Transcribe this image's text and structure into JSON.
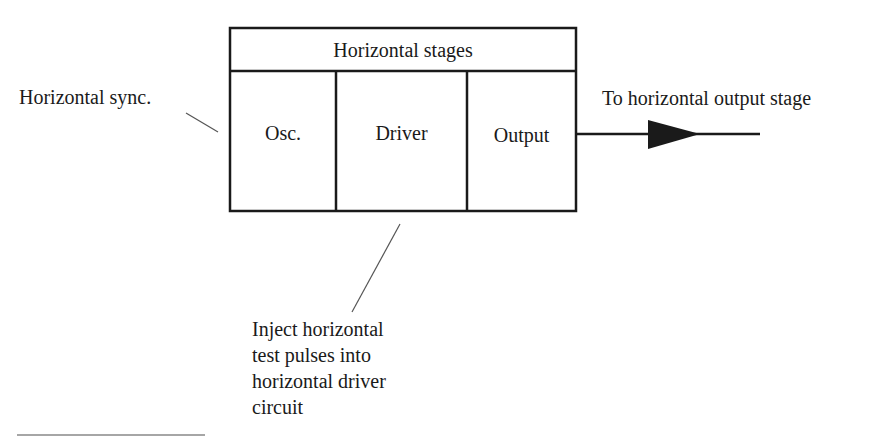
{
  "diagram": {
    "block": {
      "title": "Horizontal stages",
      "stages": [
        "Osc.",
        "Driver",
        "Output"
      ]
    },
    "labels": {
      "sync_input": "Horizontal sync.",
      "output_destination": "To horizontal output stage",
      "inject_note": [
        "Inject horizontal",
        "test pulses into",
        "horizontal driver",
        "circuit"
      ]
    },
    "colors": {
      "line": "#1a1a1a",
      "background": "#ffffff",
      "leader_line": "#555555"
    }
  }
}
